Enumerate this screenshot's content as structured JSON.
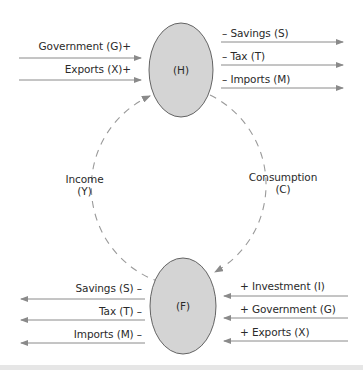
{
  "diagram": {
    "type": "circular-flow-of-income",
    "nodes": {
      "households": {
        "label": "(H)",
        "fill": "#d4d4d4",
        "stroke": "#555555"
      },
      "firms": {
        "label": "(F)",
        "fill": "#d4d4d4",
        "stroke": "#555555"
      }
    },
    "flows": {
      "income": {
        "line1": "Income",
        "line2": "(Y)"
      },
      "consumption": {
        "line1": "Consumption",
        "line2": "(C)"
      }
    },
    "households_injections": [
      {
        "label": "Government (G)+"
      },
      {
        "label": "Exports (X)+"
      }
    ],
    "households_leakages": [
      {
        "label": "– Savings (S)"
      },
      {
        "label": "– Tax (T)"
      },
      {
        "label": "– Imports (M)"
      }
    ],
    "firms_leakages": [
      {
        "label": "Savings (S) –"
      },
      {
        "label": "Tax (T) –"
      },
      {
        "label": "Imports (M) –"
      }
    ],
    "firms_injections": [
      {
        "label": "+ Investment (I)"
      },
      {
        "label": "+ Government (G)"
      },
      {
        "label": "+ Exports (X)"
      }
    ],
    "colors": {
      "arrow": "#8a8a8a",
      "dash": "#9a9a9a",
      "text": "#2a2a2a",
      "ellipse_fill": "#d4d4d4",
      "ellipse_stroke": "#555555"
    }
  }
}
